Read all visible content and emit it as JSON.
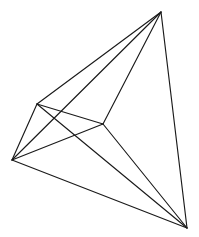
{
  "figure": {
    "title": "Wireframe polyhedron line drawing",
    "background_color": "#ffffff",
    "line_color": "#1a1a1a",
    "line_width": 1.15,
    "canvas": {
      "width": 199,
      "height": 237
    }
  },
  "chart_data": {
    "type": "scatter",
    "title": "Wireframe polyhedron line drawing",
    "xlabel": "",
    "ylabel": "",
    "xlim": [
      0,
      199
    ],
    "ylim": [
      0,
      237
    ],
    "grid": false,
    "legend": "none",
    "vertices": [
      {
        "id": "A",
        "name": "apex-top",
        "x": 161,
        "y": 12
      },
      {
        "id": "B",
        "name": "upper-left",
        "x": 37,
        "y": 104
      },
      {
        "id": "C",
        "name": "interior-middle",
        "x": 103,
        "y": 124
      },
      {
        "id": "D",
        "name": "left-lower",
        "x": 12,
        "y": 160
      },
      {
        "id": "E",
        "name": "bottom-right",
        "x": 187,
        "y": 228
      }
    ],
    "edges": [
      {
        "id": "AB",
        "from": "A",
        "to": "B",
        "x1": 161,
        "y1": 12,
        "x2": 37,
        "y2": 104
      },
      {
        "id": "AC",
        "from": "A",
        "to": "C",
        "x1": 161,
        "y1": 12,
        "x2": 103,
        "y2": 124
      },
      {
        "id": "AD",
        "from": "A",
        "to": "D",
        "x1": 161,
        "y1": 12,
        "x2": 12,
        "y2": 160
      },
      {
        "id": "AE",
        "from": "A",
        "to": "E",
        "x1": 161,
        "y1": 12,
        "x2": 187,
        "y2": 228
      },
      {
        "id": "BC",
        "from": "B",
        "to": "C",
        "x1": 37,
        "y1": 104,
        "x2": 103,
        "y2": 124
      },
      {
        "id": "BD",
        "from": "B",
        "to": "D",
        "x1": 37,
        "y1": 104,
        "x2": 12,
        "y2": 160
      },
      {
        "id": "BE",
        "from": "B",
        "to": "E",
        "x1": 37,
        "y1": 104,
        "x2": 187,
        "y2": 228
      },
      {
        "id": "CD",
        "from": "C",
        "to": "D",
        "x1": 103,
        "y1": 124,
        "x2": 12,
        "y2": 160
      },
      {
        "id": "CE",
        "from": "C",
        "to": "E",
        "x1": 103,
        "y1": 124,
        "x2": 187,
        "y2": 228
      },
      {
        "id": "DE",
        "from": "D",
        "to": "E",
        "x1": 12,
        "y1": 160,
        "x2": 187,
        "y2": 228
      }
    ],
    "vertex_count": 5,
    "edge_count": 10
  }
}
